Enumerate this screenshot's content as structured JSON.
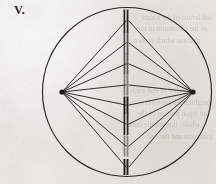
{
  "figure": {
    "label": "V.",
    "caption_visible": false,
    "medium": "aged-paper-engraving"
  },
  "colors": {
    "paper": "#f2f1ee",
    "ink": "#201d1a",
    "ink_light": "#3a3530",
    "bleed_text": "#6a6358",
    "chromosome": "#171512"
  },
  "cell": {
    "name": "cell-membrane-circle",
    "center_x": 127,
    "center_y": 92,
    "radius": 84.5,
    "stroke_width": 1.15
  },
  "poles": [
    {
      "name": "spindle-pole-left",
      "x": 62,
      "y": 92,
      "dot_radius": 2.6
    },
    {
      "name": "spindle-pole-right",
      "x": 193,
      "y": 92,
      "dot_radius": 2.6
    }
  ],
  "metaphase_plate": {
    "name": "metaphase-plate",
    "x": 127,
    "chromosome_count": 8
  },
  "chromosomes": [
    {
      "id": 1,
      "y": 21,
      "half_height": 11.5,
      "bar_gap": 3.2,
      "shade": "dark",
      "opacity": 0.95
    },
    {
      "id": 2,
      "y": 43,
      "half_height": 11.0,
      "bar_gap": 3.2,
      "shade": "medium",
      "opacity": 0.72
    },
    {
      "id": 3,
      "y": 64,
      "half_height": 10.5,
      "bar_gap": 3.0,
      "shade": "medium",
      "opacity": 0.7
    },
    {
      "id": 4,
      "y": 85,
      "half_height": 10.5,
      "bar_gap": 3.0,
      "shade": "light",
      "opacity": 0.5
    },
    {
      "id": 5,
      "y": 105,
      "half_height": 8.5,
      "bar_gap": 3.0,
      "shade": "dark",
      "opacity": 0.98
    },
    {
      "id": 6,
      "y": 124,
      "half_height": 11.0,
      "bar_gap": 3.2,
      "shade": "dark",
      "opacity": 0.92
    },
    {
      "id": 7,
      "y": 146,
      "half_height": 10.5,
      "bar_gap": 3.0,
      "shade": "light",
      "opacity": 0.45
    },
    {
      "id": 8,
      "y": 167,
      "half_height": 8.0,
      "bar_gap": 3.0,
      "shade": "dark",
      "opacity": 0.96
    }
  ],
  "spindle_fibers": {
    "name": "spindle-fibre-set",
    "stroke_width": 0.95,
    "attach_ys": [
      21,
      43,
      64,
      85,
      105,
      124,
      146,
      167
    ],
    "note": "each fibre runs from a pole to a chromosome on the plate"
  },
  "bleed_text": {
    "lines": [
      "soliferous of the nature",
      "of the chromatin in the",
      "nucleus which is then",
      "divided so that each",
      "daughter cell receives",
      "an equal portion of the",
      "whole, the spindle then",
      "contracts and the cell"
    ]
  }
}
